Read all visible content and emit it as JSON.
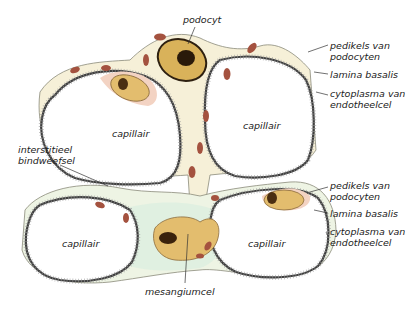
{
  "diagram": {
    "colors": {
      "cytoplasm": "#f6f0d8",
      "mesangium": "#dcefe0",
      "nucleus_fill": "#e3bd6e",
      "nucleus_dark": "#5a3a1a",
      "organelle": "#a4523f",
      "membrane": "#4a4a4a",
      "endothelial_pink": "#f3d3c3"
    }
  },
  "labels": {
    "podocyt": "podocyt",
    "top_right": {
      "pedikels_1": "pedikels van",
      "pedikels_2": "podocyten",
      "lamina": "lamina basalis",
      "cyto_1": "cytoplasma van",
      "cyto_2": "endotheelcel"
    },
    "bottom_right": {
      "pedikels_1": "pedikels van",
      "pedikels_2": "podocyten",
      "lamina": "lamina basalis",
      "cyto_1": "cytoplasma van",
      "cyto_2": "endotheelcel"
    },
    "interstitieel_1": "interstitieel",
    "interstitieel_2": "bindweefsel",
    "mesangiumcel": "mesangiumcel",
    "capillaries": [
      "capillair",
      "capillair",
      "capillair",
      "capillair"
    ]
  }
}
